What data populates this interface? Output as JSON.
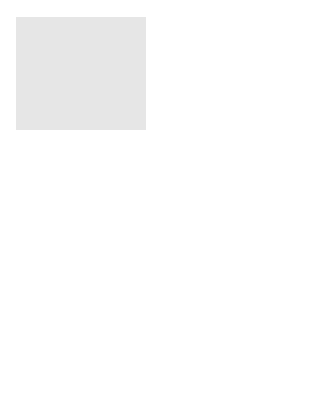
{
  "figure": {
    "background_color": "#e6e6e6",
    "brick_fill": "#e8e8e8",
    "mortar_color": "#9a9a9a",
    "line_color": "#1a1a1a"
  },
  "labels": {
    "top_plate": "Top plate",
    "upper_plank": "Scaffold plank",
    "scaffold_pipe": "Scaffold pipe",
    "lower_plank": "Scaffold plank"
  },
  "elements": {
    "worker": "person-walking-icon",
    "scaffold_planks": 2,
    "scaffold_pipe_supports": 4,
    "break_symbol": "zigzag-break-icon",
    "wall_framing": "stud-wall-section",
    "foundation_blocks": "hatched-sill"
  }
}
